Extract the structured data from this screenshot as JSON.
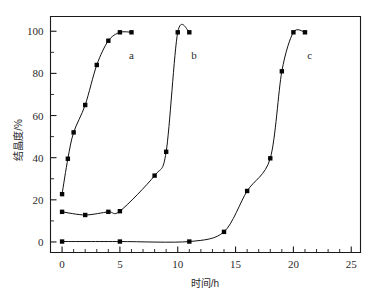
{
  "chart_data": {
    "type": "scatter",
    "title": "",
    "xlabel": "时间/h",
    "ylabel": "结晶度/%",
    "xlim": [
      -1,
      25.8
    ],
    "ylim": [
      -5,
      107
    ],
    "xticks": [
      0,
      5,
      10,
      15,
      20,
      25
    ],
    "xticklabels": [
      "0",
      "5",
      "10",
      "15",
      "20",
      "25"
    ],
    "yticks": [
      0,
      20,
      40,
      60,
      80,
      100
    ],
    "yticklabels": [
      "0",
      "20",
      "40",
      "60",
      "80",
      "100"
    ],
    "x_minor_step": 1,
    "y_minor_step": 10,
    "grid": false,
    "legend": "inline-labels",
    "marker": "filled-square",
    "series": [
      {
        "name": "a",
        "label": "a",
        "label_x": 6.0,
        "label_y": 87.0,
        "x": [
          0,
          0.5,
          1,
          2,
          3,
          4,
          5,
          6
        ],
        "y": [
          22.7,
          39.5,
          52.0,
          65.0,
          84.0,
          95.5,
          99.5,
          99.5
        ]
      },
      {
        "name": "b",
        "label": "b",
        "label_x": 11.4,
        "label_y": 87.0,
        "x": [
          0,
          2,
          4,
          5,
          8,
          9,
          10,
          11
        ],
        "y": [
          14.3,
          12.8,
          14.3,
          14.6,
          31.5,
          42.8,
          99.5,
          99.5
        ]
      },
      {
        "name": "c",
        "label": "c",
        "label_x": 21.4,
        "label_y": 87.0,
        "x": [
          0,
          5,
          11,
          14,
          16,
          18,
          19,
          20,
          21
        ],
        "y": [
          0.2,
          0.2,
          0.2,
          4.8,
          24.2,
          39.7,
          81.0,
          99.5,
          99.5
        ]
      }
    ]
  },
  "axes": {
    "x_axis_name": "time-axis",
    "y_axis_name": "crystallinity-axis"
  }
}
